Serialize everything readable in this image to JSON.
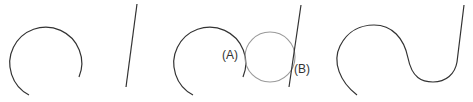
{
  "diagram": {
    "colors": {
      "stroke": "#333333",
      "construction_circle": "#9a9a9a",
      "background": "#ffffff"
    },
    "panels": [
      {
        "name": "original-arc-and-line",
        "elements": [
          "arc",
          "line"
        ]
      },
      {
        "name": "tangent-circle-construction",
        "elements": [
          "arc",
          "construction-circle",
          "line"
        ],
        "labels": [
          "(A)",
          "(B)"
        ]
      },
      {
        "name": "filleted-result",
        "elements": [
          "blended-curve"
        ]
      }
    ],
    "labels": {
      "a": "(A)",
      "b": "(B)"
    }
  }
}
